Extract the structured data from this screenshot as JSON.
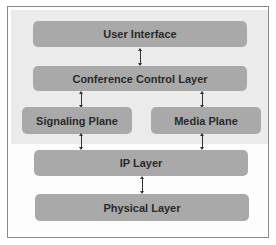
{
  "diagram": {
    "layers": {
      "user_interface": "User Interface",
      "conference_control": "Conference Control Layer",
      "signaling_plane": "Signaling Plane",
      "media_plane": "Media Plane",
      "ip_layer": "IP Layer",
      "physical_layer": "Physical Layer"
    },
    "connections": [
      {
        "from": "User Interface",
        "to": "Conference Control Layer",
        "type": "bidirectional"
      },
      {
        "from": "Conference Control Layer",
        "to": "Signaling Plane",
        "type": "bidirectional"
      },
      {
        "from": "Conference Control Layer",
        "to": "Media Plane",
        "type": "bidirectional"
      },
      {
        "from": "Signaling Plane",
        "to": "IP Layer",
        "type": "bidirectional"
      },
      {
        "from": "Media Plane",
        "to": "IP Layer",
        "type": "bidirectional"
      },
      {
        "from": "IP Layer",
        "to": "Physical Layer",
        "type": "bidirectional"
      }
    ],
    "colors": {
      "box_fill": "#a9a9a9",
      "upper_region_fill": "#ebebeb",
      "frame_border": "#8a8a8a",
      "text": "#2a2a2a"
    }
  }
}
